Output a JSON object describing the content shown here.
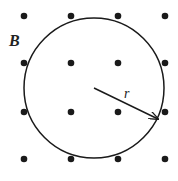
{
  "diagram": {
    "field_label": "B",
    "radius_label": "r",
    "field_symbol": "dot (out of page)",
    "grid": {
      "rows": 4,
      "cols": 4,
      "x": [
        24,
        71,
        118,
        165
      ],
      "y": [
        16,
        63,
        112,
        159
      ]
    },
    "circle": {
      "cx": 94,
      "cy": 88,
      "r": 70
    },
    "colors": {
      "ink": "#1a1a1a",
      "background": "#ffffff"
    }
  }
}
